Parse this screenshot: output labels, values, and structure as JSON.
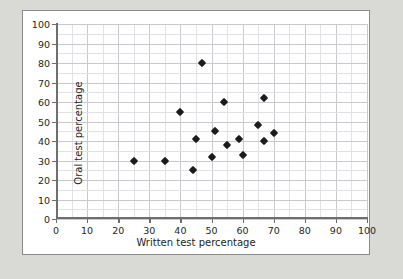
{
  "chart_data": {
    "type": "scatter",
    "title": "",
    "xlabel": "Written test percentage",
    "ylabel": "Oral test percentage",
    "xlim": [
      0,
      100
    ],
    "ylim": [
      0,
      100
    ],
    "xticks": [
      0,
      10,
      20,
      30,
      40,
      50,
      60,
      70,
      80,
      90,
      100
    ],
    "yticks": [
      0,
      10,
      20,
      30,
      40,
      50,
      60,
      70,
      80,
      90,
      100
    ],
    "grid": true,
    "minor_grid_step": 5,
    "legend": null,
    "marker": "diamond",
    "marker_color": "#1b1b1b",
    "points": [
      {
        "x": 25,
        "y": 30
      },
      {
        "x": 35,
        "y": 30
      },
      {
        "x": 40,
        "y": 55
      },
      {
        "x": 44,
        "y": 25
      },
      {
        "x": 45,
        "y": 41
      },
      {
        "x": 47,
        "y": 80
      },
      {
        "x": 50,
        "y": 32
      },
      {
        "x": 51,
        "y": 45
      },
      {
        "x": 54,
        "y": 60
      },
      {
        "x": 55,
        "y": 38
      },
      {
        "x": 59,
        "y": 41
      },
      {
        "x": 60,
        "y": 33
      },
      {
        "x": 65,
        "y": 48
      },
      {
        "x": 67,
        "y": 62
      },
      {
        "x": 67,
        "y": 40
      },
      {
        "x": 70,
        "y": 44
      }
    ]
  },
  "figure": {
    "background": "#ffffff",
    "page_background": "#d9d9d6",
    "border_color": "#8a8a88",
    "grid_major_color": "#c9c9cd",
    "grid_minor_color": "#e2e2e6",
    "axis_color": "#6e6e6e"
  }
}
